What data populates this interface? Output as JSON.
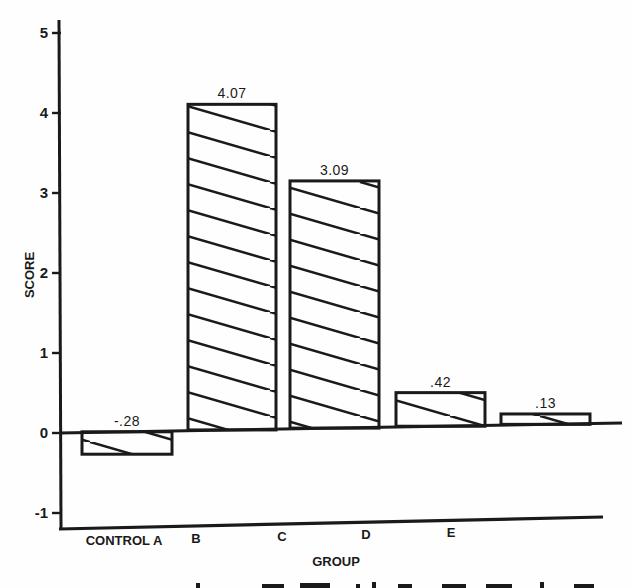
{
  "chart_data": {
    "type": "bar",
    "title": "",
    "xlabel": "GROUP",
    "ylabel": "SCORE",
    "categories": [
      "CONTROL A",
      "B",
      "C",
      "D",
      "E"
    ],
    "values": [
      -0.28,
      4.07,
      3.09,
      0.42,
      0.13
    ],
    "value_labels": [
      "-.28",
      "4.07",
      "3.09",
      ".42",
      ".13"
    ],
    "yticks": [
      5,
      4,
      3,
      2,
      1,
      0,
      -1
    ],
    "ytick_labels": [
      "5",
      "4",
      "3",
      "2",
      "1",
      "0",
      "-1"
    ],
    "ylim": [
      -1.2,
      5.2
    ],
    "grid": false,
    "legend": null,
    "bar_fill": "diagonal-hatch",
    "ink_color": "#1a1a1a",
    "paper_color": "#fefefe"
  }
}
